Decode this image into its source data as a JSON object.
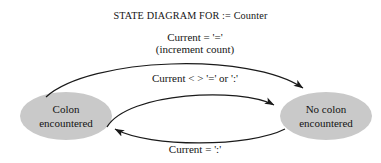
{
  "diagram": {
    "title": "STATE DIAGRAM FOR := Counter",
    "type": "state-diagram",
    "background_color": "#ffffff",
    "node_fill_color": "#c9c9c9",
    "edge_color": "#1a1a1a",
    "text_color": "#141414",
    "states": [
      {
        "id": "colon-encountered",
        "line1": "Colon",
        "line2": "encountered",
        "shape": "ellipse",
        "position": "left"
      },
      {
        "id": "no-colon-encountered",
        "line1": "No colon",
        "line2": "encountered",
        "shape": "ellipse",
        "position": "right"
      }
    ],
    "transitions": [
      {
        "id": "increment-transition",
        "from": "colon-encountered",
        "to": "no-colon-encountered",
        "label_line1": "Current = '='",
        "label_line2": "(increment count)",
        "arc": "outer-top"
      },
      {
        "id": "other-char-transition",
        "from": "colon-encountered",
        "to": "no-colon-encountered",
        "label_line1": "Current < > '=' or ':'",
        "label_line2": "",
        "arc": "inner-top"
      },
      {
        "id": "colon-transition",
        "from": "no-colon-encountered",
        "to": "colon-encountered",
        "label_line1": "Current = ':'",
        "label_line2": "",
        "arc": "bottom"
      }
    ]
  }
}
